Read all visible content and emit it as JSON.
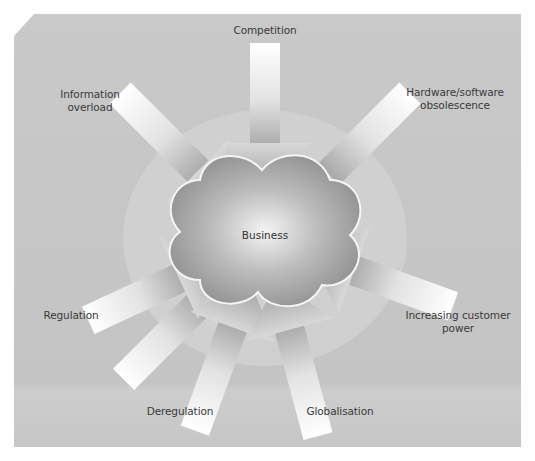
{
  "diagram": {
    "type": "radial-forces",
    "center": {
      "label": "Business",
      "shape": "cloud"
    },
    "forces": [
      {
        "id": "competition",
        "label": "Competition",
        "direction": "top"
      },
      {
        "id": "hardware-software-obsolescence",
        "label_line1": "Hardware/software",
        "label_line2": "obsolescence",
        "direction": "top-right"
      },
      {
        "id": "increasing-customer-power",
        "label_line1": "Increasing customer",
        "label_line2": "power",
        "direction": "right-lower"
      },
      {
        "id": "globalisation",
        "label": "Globalisation",
        "direction": "bottom-right"
      },
      {
        "id": "deregulation",
        "label": "Deregulation",
        "direction": "bottom-left"
      },
      {
        "id": "regulation",
        "label": "Regulation",
        "direction": "left-lower"
      },
      {
        "id": "information-overload",
        "label_line1": "Information",
        "label_line2": "overload",
        "direction": "top-left"
      }
    ],
    "colors": {
      "panel": "#c6c6c6",
      "panel_light": "#cfcfcf",
      "cloud_dark": "#8e8e8e",
      "cloud_light": "#f2f2f2",
      "arrow_light": "#fafafa",
      "arrow_dark": "#a9a9a9",
      "text": "#3a3a3a"
    }
  }
}
